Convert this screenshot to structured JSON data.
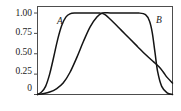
{
  "chart_data": {
    "type": "line",
    "title": "",
    "subtitle": "",
    "xlabel": "",
    "ylabel": "",
    "xlim": [
      0,
      1
    ],
    "ylim": [
      0,
      1.08
    ],
    "grid": false,
    "legend_position": "inline-annotations",
    "ytick_labels": [
      "1.00",
      "0.75",
      "0.50",
      "0.25",
      "0"
    ],
    "ytick_values": [
      1.0,
      0.75,
      0.5,
      0.25,
      0
    ],
    "xtick_labels": [],
    "annotations": [
      {
        "text": "A",
        "x": 0.16,
        "y": 0.93,
        "style": "italic"
      },
      {
        "text": "B",
        "x": 0.89,
        "y": 0.93,
        "style": "italic"
      }
    ],
    "series": [
      {
        "name": "A",
        "color": "#141414",
        "x": [
          0.0,
          0.03,
          0.06,
          0.09,
          0.12,
          0.15,
          0.18,
          0.21,
          0.24,
          0.28,
          0.33,
          0.4,
          0.46,
          0.5,
          0.56,
          0.62,
          0.68,
          0.74,
          0.8,
          0.86,
          0.9,
          0.93,
          0.96,
          1.0
        ],
        "y": [
          0.0,
          0.03,
          0.1,
          0.25,
          0.46,
          0.68,
          0.85,
          0.95,
          0.99,
          1.0,
          1.0,
          1.0,
          1.0,
          0.98,
          0.89,
          0.79,
          0.69,
          0.59,
          0.49,
          0.4,
          0.34,
          0.28,
          0.21,
          0.14
        ]
      },
      {
        "name": "B",
        "color": "#141414",
        "x": [
          0.0,
          0.04,
          0.09,
          0.14,
          0.19,
          0.24,
          0.29,
          0.34,
          0.39,
          0.44,
          0.48,
          0.54,
          0.61,
          0.68,
          0.75,
          0.8,
          0.83,
          0.85,
          0.87,
          0.89,
          0.92,
          0.96,
          1.0
        ],
        "y": [
          0.0,
          0.01,
          0.03,
          0.07,
          0.14,
          0.27,
          0.45,
          0.65,
          0.83,
          0.95,
          1.0,
          1.0,
          1.0,
          1.0,
          1.0,
          0.98,
          0.9,
          0.76,
          0.52,
          0.28,
          0.1,
          0.02,
          0.0
        ]
      }
    ]
  },
  "frame": {
    "border_color": "#4d4d4d",
    "background": "#ffffff"
  }
}
